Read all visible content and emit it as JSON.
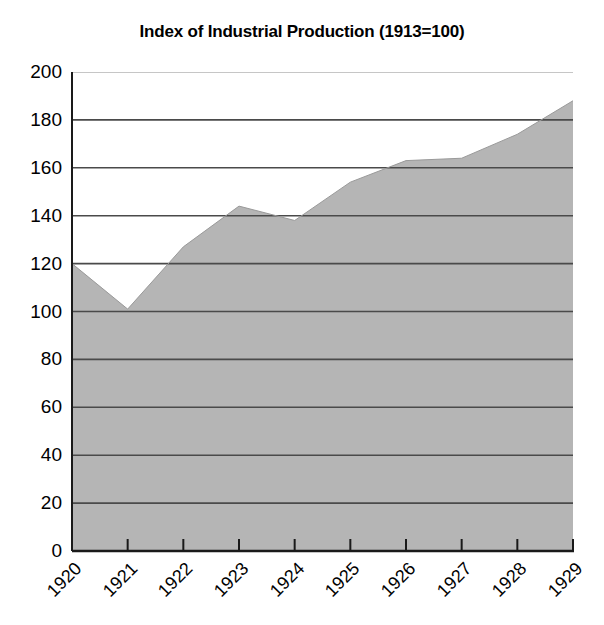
{
  "chart_data": {
    "type": "area",
    "title": "Index of Industrial Production (1913=100)",
    "xlabel": "",
    "ylabel": "",
    "categories": [
      "1920",
      "1921",
      "1922",
      "1923",
      "1924",
      "1925",
      "1926",
      "1927",
      "1928",
      "1929"
    ],
    "values": [
      120,
      101,
      127,
      144,
      138,
      154,
      163,
      164,
      174,
      188
    ],
    "series": [
      {
        "name": "Index of Industrial Production",
        "values": [
          120,
          101,
          127,
          144,
          138,
          154,
          163,
          164,
          174,
          188
        ]
      }
    ],
    "ylim": [
      0,
      200
    ],
    "ytick_labels": [
      "200",
      "180",
      "160",
      "140",
      "120",
      "100",
      "80",
      "60",
      "40",
      "20",
      "0"
    ],
    "ytick_values": [
      200,
      180,
      160,
      140,
      120,
      100,
      80,
      60,
      40,
      20,
      0
    ],
    "grid": true,
    "legend": "none",
    "colors": {
      "area_fill": "#b5b5b5",
      "gridline": "#4a4a4a",
      "top_gridline": "#8d8d8d",
      "axis": "#1a1a1a",
      "text": "#000000",
      "background": "#ffffff"
    }
  }
}
